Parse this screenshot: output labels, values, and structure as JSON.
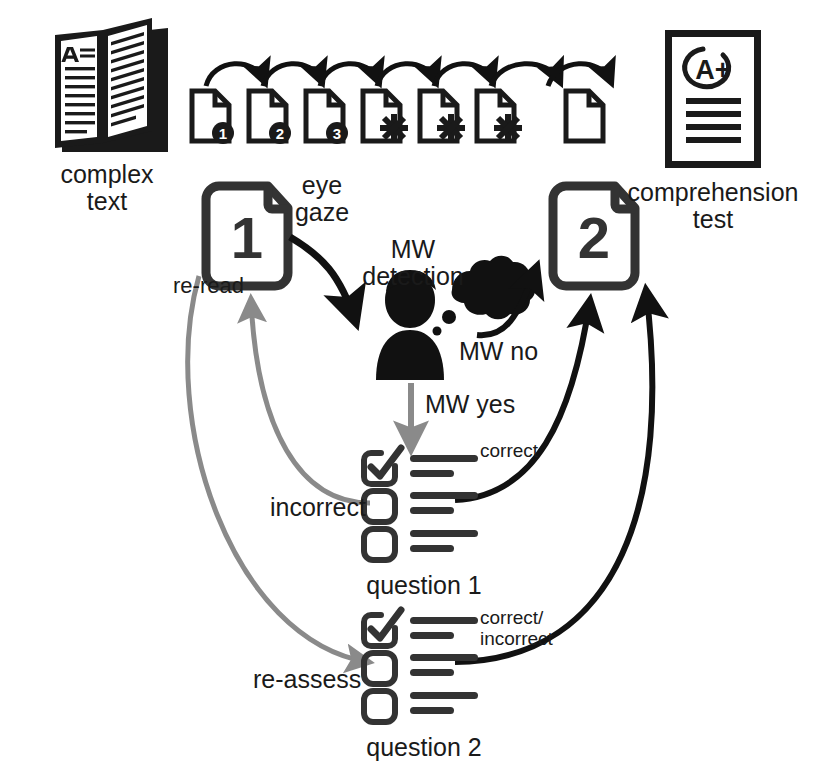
{
  "diagram": {
    "colors": {
      "ink": "#1a1a1a",
      "black_arrow": "#111111",
      "gray_arrow": "#8a8a8a",
      "background": "#ffffff"
    }
  },
  "icons": {
    "book": {
      "name": "open-book-icon",
      "caption_line1": "complex",
      "caption_line2": "text",
      "page_letter": "A"
    },
    "test_sheet": {
      "name": "graded-test-sheet-icon",
      "caption_line1": "comprehension",
      "caption_line2": "test",
      "grade": "A+"
    }
  },
  "reading_sequence": {
    "name": "page-sequence-strip",
    "pages": [
      {
        "badge": "1",
        "marker": "number"
      },
      {
        "badge": "2",
        "marker": "number"
      },
      {
        "badge": "3",
        "marker": "number"
      },
      {
        "badge": "*",
        "marker": "asterisk"
      },
      {
        "badge": "*",
        "marker": "asterisk"
      },
      {
        "badge": "*",
        "marker": "asterisk"
      },
      {
        "badge": "",
        "marker": "none"
      }
    ]
  },
  "nodes": {
    "page1": {
      "label": "1",
      "name": "page-1-node"
    },
    "page2": {
      "label": "2",
      "name": "page-2-node"
    },
    "reader": {
      "name": "reader-with-thought-bubble-icon"
    }
  },
  "labels": {
    "eye_gaze": "eye\ngaze",
    "mw_detection": "MW\ndetection",
    "mw_no": "MW no",
    "mw_yes": "MW yes",
    "re_read": "re-read",
    "incorrect": "incorrect",
    "re_assess": "re-assess",
    "correct": "correct",
    "correct_incorrect": "correct/\nincorrect"
  },
  "questions": [
    {
      "name": "question-1",
      "caption": "question 1",
      "outcome_label": "correct",
      "options": [
        {
          "checked": true,
          "lines": [
            1,
            2
          ]
        },
        {
          "checked": false,
          "lines": [
            1,
            2
          ]
        },
        {
          "checked": false,
          "lines": [
            1,
            2
          ]
        }
      ]
    },
    {
      "name": "question-2",
      "caption": "question 2",
      "outcome_label": "correct/\nincorrect",
      "options": [
        {
          "checked": true,
          "lines": [
            1,
            2
          ]
        },
        {
          "checked": false,
          "lines": [
            1,
            2
          ]
        },
        {
          "checked": false,
          "lines": [
            1,
            2
          ]
        }
      ]
    }
  ]
}
